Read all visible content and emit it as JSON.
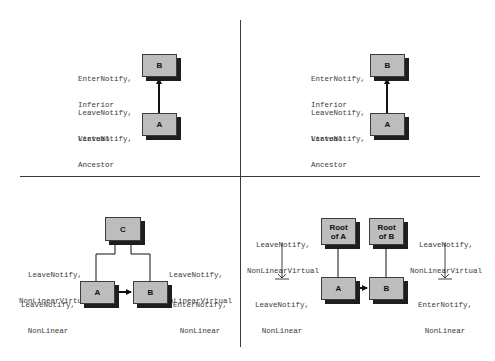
{
  "colors": {
    "box_fill": "#bdbdbd",
    "box_border": "#3c3c3c",
    "box_shadow": "#1e1e1e",
    "line": "#111111",
    "divider": "#3a3a3a",
    "label_text": "#3a3a3a"
  },
  "panels": {
    "top_left": {
      "boxes": {
        "b": "B",
        "a": "A"
      },
      "labels": {
        "b_event": [
          "EnterNotify,",
          "Inferior"
        ],
        "mid_event": [
          "LeaveNotify,",
          "Virtual"
        ],
        "a_event": [
          "LeaveNotify,",
          "Ancestor"
        ]
      }
    },
    "top_right": {
      "boxes": {
        "b": "B",
        "a": "A"
      },
      "labels": {
        "b_event": [
          "EnterNotify,",
          "Inferior"
        ],
        "mid_event": [
          "LeaveNotify,",
          "Virtual"
        ],
        "a_event": [
          "LeaveNotify,",
          "Ancestor"
        ]
      }
    },
    "bottom_left": {
      "boxes": {
        "c": "C",
        "a": "A",
        "b": "B"
      },
      "labels": {
        "left_virtual": [
          "LeaveNotify,",
          "NonLinearVirtual"
        ],
        "right_virtual": [
          "LeaveNotify,",
          "NonLinearVirtual"
        ],
        "a_event": [
          "LeaveNotify,",
          "NonLinear"
        ],
        "b_event": [
          "EnterNotify,",
          "NonLinear"
        ]
      }
    },
    "bottom_right": {
      "boxes": {
        "root_a": [
          "Root",
          "of A"
        ],
        "root_b": [
          "Root",
          "of B"
        ],
        "a": "A",
        "b": "B"
      },
      "labels": {
        "left_virtual": [
          "LeaveNotify,",
          "NonLinearVirtual"
        ],
        "right_virtual": [
          "LeaveNotify,",
          "NonLinearVirtual"
        ],
        "a_event": [
          "LeaveNotify,",
          "NonLinear"
        ],
        "b_event": [
          "EnterNotify,",
          "NonLinear"
        ]
      }
    }
  }
}
